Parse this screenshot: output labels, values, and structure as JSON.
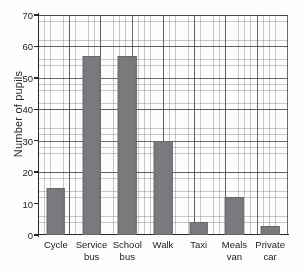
{
  "chart_data": {
    "type": "bar",
    "title": "",
    "xlabel": "",
    "ylabel": "Number of pupils",
    "ylim": [
      0,
      70
    ],
    "ytick_step": 10,
    "yticks": [
      0,
      10,
      20,
      30,
      40,
      50,
      60,
      70
    ],
    "grid": "graph-paper: minor gridlines every 1 unit, major gridlines every 5 units",
    "legend": "none",
    "categories": [
      "Cycle",
      "Service bus",
      "School bus",
      "Walk",
      "Taxi",
      "Meals van",
      "Private car"
    ],
    "category_lines": [
      [
        "Cycle",
        ""
      ],
      [
        "Service",
        "bus"
      ],
      [
        "School",
        "bus"
      ],
      [
        "Walk",
        ""
      ],
      [
        "Taxi",
        ""
      ],
      [
        "Meals",
        "van"
      ],
      [
        "Private",
        "car"
      ]
    ],
    "values": [
      15,
      57,
      57,
      30,
      4,
      12,
      3
    ],
    "bar_color": "#7a7a7e"
  },
  "colors": {
    "bar": "#7a7a7e",
    "axis": "#2a2a2a",
    "grid_minor": "#787880",
    "grid_major": "#46464e",
    "paper": "#fdfdfb",
    "text": "#1d1d1d"
  }
}
